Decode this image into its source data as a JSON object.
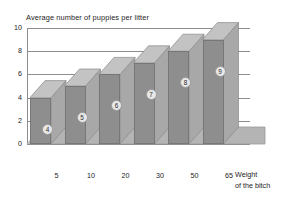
{
  "chart_data": {
    "type": "bar",
    "title": "Average number of puppies per litter",
    "xlabel": "Weight of the bitch",
    "ylabel": "Average number of puppies per litter",
    "categories": [
      "5",
      "10",
      "20",
      "30",
      "50",
      "65"
    ],
    "values": [
      4,
      5,
      6,
      7,
      8,
      9
    ],
    "data_labels": [
      "4",
      "5",
      "6",
      "7",
      "8",
      "9"
    ],
    "ylim": [
      0,
      10
    ],
    "y_ticks": [
      "0",
      "2",
      "4",
      "6",
      "8",
      "10"
    ],
    "y_tick_values": [
      0,
      2,
      4,
      6,
      8,
      10
    ],
    "grid": true,
    "legend": "none",
    "style": "3d-bar",
    "colors": {
      "bar_front": "#8e8e8e",
      "bar_side": "#a8a8a8",
      "bar_top": "#c3c3c3",
      "floor": "#b4b4b4",
      "grid": "#8d8d8d",
      "background": "#ffffff",
      "text": "#1c1c1c"
    }
  },
  "axis_title_lines": {
    "line1": "Weight",
    "line2": "of the bitch"
  }
}
